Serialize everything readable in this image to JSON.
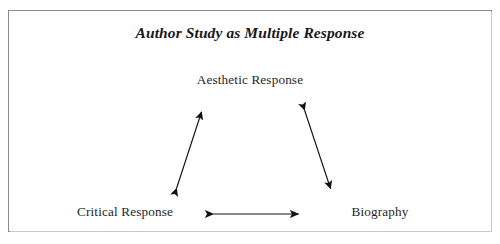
{
  "figure": {
    "title": "Author Study as Multiple Response",
    "background_color": "#ffffff",
    "frame_color": "#8d8d8d",
    "ink_color": "#19191b"
  },
  "nodes": [
    {
      "id": "aesthetic",
      "label": "Aesthetic Response",
      "position": "top-center"
    },
    {
      "id": "critical",
      "label": "Critical Response",
      "position": "bottom-left"
    },
    {
      "id": "biography",
      "label": "Biography",
      "position": "bottom-right"
    }
  ],
  "arrows": [
    {
      "id": "critical-aesthetic",
      "from": "Critical Response",
      "to": "Aesthetic Response",
      "style": "double-headed",
      "orientation": "diagonal-up-right"
    },
    {
      "id": "aesthetic-biography",
      "from": "Aesthetic Response",
      "to": "Biography",
      "style": "double-headed",
      "orientation": "diagonal-down-right"
    },
    {
      "id": "critical-biography",
      "from": "Critical Response",
      "to": "Biography",
      "style": "double-headed",
      "orientation": "horizontal"
    }
  ]
}
